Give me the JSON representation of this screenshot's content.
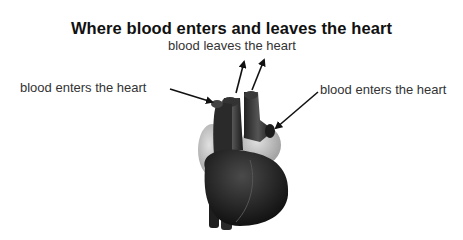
{
  "title": "Where blood enters and leaves the heart",
  "labels": {
    "leaves": "blood leaves the heart",
    "enters_left": "blood enters the heart",
    "enters_right": "blood enters the heart"
  },
  "colors": {
    "heart_dark": "#1a1a1a",
    "heart_mid": "#3a3a3a",
    "heart_light": "#c8c8c8",
    "arrow": "#111111"
  }
}
